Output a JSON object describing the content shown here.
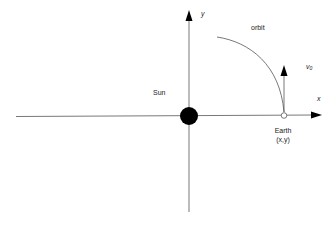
{
  "diagram": {
    "type": "orbital-coordinate-diagram",
    "colors": {
      "axis": "#555555",
      "sun": "#000000",
      "orbit": "#555555",
      "text": "#222222",
      "background": "#ffffff"
    },
    "axes": {
      "x_label": "x",
      "y_label": "y"
    },
    "sun": {
      "label": "Sun"
    },
    "orbit": {
      "label": "orbit"
    },
    "earth": {
      "label": "Earth",
      "coords_label": "(x,y)"
    },
    "velocity": {
      "label": "v",
      "subscript": "0"
    }
  }
}
